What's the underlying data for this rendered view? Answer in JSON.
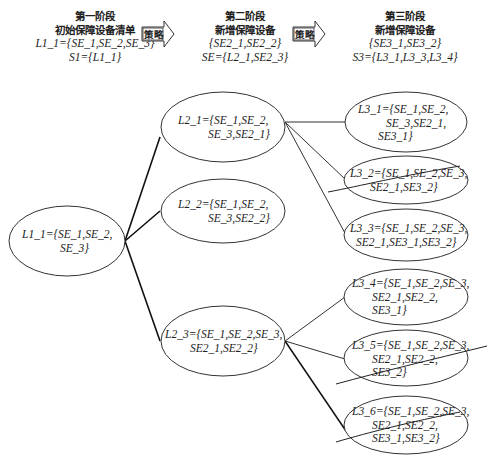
{
  "stages": [
    {
      "title": "第一阶段",
      "subtitle": "初始保障设备清单",
      "line1": "L1_1={SE_1,SE_2,SE_3}",
      "line2": "S1={L1_1}"
    },
    {
      "title": "第二阶段",
      "subtitle": "新增保障设备",
      "line1": "{SE2_1,SE2_2}",
      "line2": "SE={L2_1,SE2_3}"
    },
    {
      "title": "第三阶段",
      "subtitle": "新增保障设备",
      "line1": "{SE3_1,SE3_2}",
      "line2": "S3={L3_1,L3_3,L3_4}"
    }
  ],
  "arrows": [
    {
      "label": "策略"
    },
    {
      "label": "策略"
    }
  ],
  "nodes": {
    "L1_1": {
      "line1": "L1_1={SE_1,SE_2,",
      "line2": "SE_3}",
      "line3": ""
    },
    "L2_1": {
      "line1": "L2_1={SE_1,SE_2,",
      "line2": "SE_3,SE2_1}",
      "line3": ""
    },
    "L2_2": {
      "line1": "L2_2={SE_1,SE_2,",
      "line2": "SE_3,SE2_2}",
      "line3": ""
    },
    "L2_3": {
      "line1": "L2_3={SE_1,SE_2,SE_3,",
      "line2": "SE2_1,SE2_2}",
      "line3": ""
    },
    "L3_1": {
      "line1": "L3_1={SE_1,SE_2,",
      "line2": "SE_3,SE2_1,",
      "line3": "SE3_1}",
      "crossed": false
    },
    "L3_2": {
      "line1": "L3_2={SE_1,SE_2,SE_3,",
      "line2": "SE2_1,SE3_2}",
      "line3": "",
      "crossed": true
    },
    "L3_3": {
      "line1": "L3_3={SE_1,SE_2,SE_3,",
      "line2": "SE2_1,SE3_1,SE3_2}",
      "line3": "",
      "crossed": false
    },
    "L3_4": {
      "line1": "L3_4={SE_1,SE_2,SE_3,",
      "line2": "SE2_1,SE2_2,",
      "line3": "SE3_1}",
      "crossed": false
    },
    "L3_5": {
      "line1": "L3_5={SE_1,SE_2,SE_3,",
      "line2": "SE2_1,SE2_2,",
      "line3": "SE3_2}",
      "crossed": true
    },
    "L3_6": {
      "line1": "L3_6={SE_1,SE_2,SE_3,",
      "line2": "SE2_1,SE2_2,",
      "line3": "SE3_1,SE3_2}",
      "crossed": true
    }
  },
  "edges": [
    [
      "L1_1",
      "L2_1"
    ],
    [
      "L1_1",
      "L2_2"
    ],
    [
      "L1_1",
      "L2_3"
    ],
    [
      "L2_1",
      "L3_1"
    ],
    [
      "L2_1",
      "L3_2"
    ],
    [
      "L2_1",
      "L3_3"
    ],
    [
      "L2_3",
      "L3_4"
    ],
    [
      "L2_3",
      "L3_5"
    ],
    [
      "L2_3",
      "L3_6"
    ]
  ]
}
